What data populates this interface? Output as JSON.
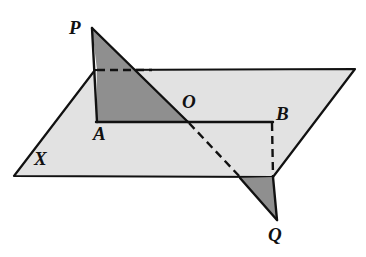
{
  "figure": {
    "type": "geometry-diagram",
    "canvas": {
      "width": 366,
      "height": 257
    },
    "colors": {
      "background": "#ffffff",
      "plane_fill": "#e2e2e2",
      "triangle_fill": "#8f8f8f",
      "stroke": "#111111",
      "label_color": "#111111"
    },
    "stroke_width": 2.2,
    "dash_pattern": "7,5"
  },
  "labels": {
    "P": {
      "text": "P",
      "x": 69,
      "y": 18
    },
    "A": {
      "text": "A",
      "x": 93,
      "y": 124
    },
    "O": {
      "text": "O",
      "x": 182,
      "y": 92
    },
    "B": {
      "text": "B",
      "x": 276,
      "y": 104
    },
    "X": {
      "text": "X",
      "x": 34,
      "y": 149
    },
    "Q": {
      "text": "Q",
      "x": 268,
      "y": 225
    }
  },
  "points": {
    "P": {
      "x": 92,
      "y": 28
    },
    "A": {
      "x": 97,
      "y": 122
    },
    "O": {
      "x": 188,
      "y": 122
    },
    "B": {
      "x": 272,
      "y": 122
    },
    "Q": {
      "x": 277,
      "y": 220
    },
    "M": {
      "x": 97,
      "y": 70
    },
    "N": {
      "x": 240,
      "y": 178
    },
    "plane_top_left": {
      "x": 95,
      "y": 70
    },
    "plane_top_right": {
      "x": 355,
      "y": 69
    },
    "plane_bottom_right": {
      "x": 273,
      "y": 177
    },
    "plane_bottom_left": {
      "x": 14,
      "y": 176
    }
  },
  "shapes": {
    "plane_X": {
      "name": "plane-X",
      "polygon": "95,70 355,69 273,177 14,176",
      "fill": "plane_fill"
    },
    "triangle_upper": {
      "name": "triangle-upper-PAO",
      "polygon": "92,28 188,122 97,122 97,70",
      "fill": "triangle_fill"
    },
    "triangle_lower": {
      "name": "triangle-lower-Q",
      "polygon": "240,178 273,177 277,220",
      "fill": "triangle_fill"
    }
  },
  "edges": {
    "segment_PO": {
      "from": "P",
      "to": "O",
      "style": "solid"
    },
    "segment_PA": {
      "from": "P",
      "to": "A",
      "style": "solid"
    },
    "segment_AO": {
      "from": "A",
      "to": "O",
      "style": "solid"
    },
    "segment_OB": {
      "from": "O",
      "to": "B",
      "style": "solid"
    },
    "segment_MA_hidden": {
      "from": "M",
      "to": "A",
      "style": "solid"
    },
    "dashed_MN_top": {
      "from": "M",
      "to": "plane_top_left",
      "style": "dashed"
    },
    "dashed_OQ": {
      "from": "O",
      "to": "N",
      "style": "dashed"
    },
    "dashed_BQ": {
      "from": "B",
      "to": "plane_bottom_right",
      "style": "dashed"
    },
    "segment_NQ": {
      "from": "N",
      "to": "Q",
      "style": "solid"
    },
    "segment_QR": {
      "from": "Q",
      "to": "plane_bottom_right",
      "style": "solid"
    }
  }
}
